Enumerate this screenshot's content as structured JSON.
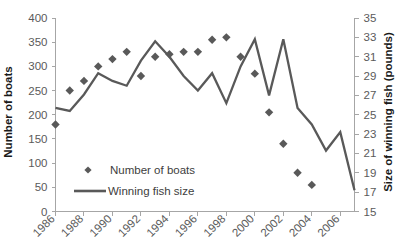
{
  "chart_data": {
    "type": "line",
    "title": "",
    "subtitle": "",
    "xlabel": "",
    "ylabel": "Number of boats",
    "y2label": "Size of winning fish (pounds)",
    "grid": false,
    "legend_position": "inside-lower-left",
    "x": [
      1986,
      1987,
      1988,
      1989,
      1990,
      1991,
      1992,
      1993,
      1994,
      1995,
      1996,
      1997,
      1998,
      1999,
      2000,
      2001,
      2002,
      2003,
      2004,
      2005,
      2006,
      2007
    ],
    "xticks": [
      1986,
      1988,
      1990,
      1992,
      1994,
      1996,
      1998,
      2000,
      2002,
      2004,
      2006
    ],
    "xtick_labels": [
      "1986",
      "1988",
      "1990",
      "1992",
      "1994",
      "1996",
      "1998",
      "2000",
      "2002",
      "2004",
      "2006"
    ],
    "xlim": [
      1986,
      2007
    ],
    "ylim": [
      0,
      400
    ],
    "yticks": [
      0,
      50,
      100,
      150,
      200,
      250,
      300,
      350,
      400
    ],
    "ytick_labels": [
      "0",
      "50",
      "100",
      "150",
      "200",
      "250",
      "300",
      "350",
      "400"
    ],
    "y2lim": [
      15,
      35
    ],
    "y2ticks": [
      15,
      17,
      19,
      21,
      23,
      25,
      27,
      29,
      31,
      33,
      35
    ],
    "y2tick_labels": [
      "15",
      "17",
      "19",
      "21",
      "23",
      "25",
      "27",
      "29",
      "31",
      "33",
      "35"
    ],
    "series": [
      {
        "name": "Number of boats",
        "type": "scatter",
        "marker": "diamond",
        "axis": "left",
        "color": "#595959",
        "values": [
          180,
          250,
          270,
          300,
          315,
          330,
          280,
          320,
          325,
          330,
          330,
          355,
          360,
          320,
          285,
          205,
          140,
          80,
          55,
          null,
          null,
          null
        ]
      },
      {
        "name": "Winning fish size",
        "type": "line",
        "axis": "right",
        "color": "#595959",
        "values": [
          25.7,
          25.4,
          27.1,
          29.3,
          28.5,
          28.0,
          30.6,
          32.6,
          31.0,
          29.0,
          27.5,
          29.3,
          26.2,
          30.0,
          32.8,
          27.0,
          32.8,
          25.7,
          24.0,
          21.3,
          23.2,
          17.2
        ]
      }
    ],
    "legend": [
      {
        "label": "Number of boats",
        "marker": "diamond",
        "color": "#595959"
      },
      {
        "label": "Winning fish size",
        "marker": "line",
        "color": "#595959"
      }
    ]
  },
  "colors": {
    "series": "#595959",
    "axis": "#a6a6a6",
    "tick_text": "#5a5a5a",
    "title_text": "#1a1a1a",
    "background": "#ffffff"
  }
}
